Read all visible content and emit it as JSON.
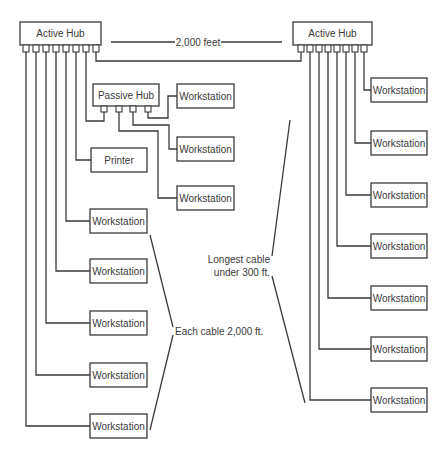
{
  "diagram": {
    "left_hub": {
      "label": "Active Hub",
      "ports": 8
    },
    "right_hub": {
      "label": "Active Hub",
      "ports": 8
    },
    "passive_hub": {
      "label": "Passive Hub",
      "ports": 4
    },
    "hub_link_label": "2,000 feet",
    "printer_label": "Printer",
    "workstation_label": "Workstation",
    "passive_workstations": [
      "Workstation",
      "Workstation",
      "Workstation"
    ],
    "left_workstations": [
      "Workstation",
      "Workstation",
      "Workstation",
      "Workstation",
      "Workstation"
    ],
    "right_workstations": [
      "Workstation",
      "Workstation",
      "Workstation",
      "Workstation",
      "Workstation",
      "Workstation",
      "Workstation"
    ],
    "annotations": {
      "left_cables": "Each cable 2,000 ft.",
      "right_cables_line1": "Longest cable",
      "right_cables_line2": "under 300 ft."
    },
    "colors": {
      "stroke": "#3a3a3a",
      "background": "#ffffff"
    }
  }
}
